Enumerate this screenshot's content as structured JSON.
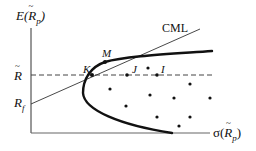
{
  "diagram": {
    "type": "efficient-frontier-cml",
    "y_axis_label": {
      "main": "E(",
      "var": "R",
      "sub": "p",
      "close": ")"
    },
    "x_axis_label": {
      "main": "σ(",
      "var": "R",
      "sub": "p",
      "close": ")"
    },
    "y_ticks": {
      "r_bar": "R",
      "r_f": {
        "main": "R",
        "sub": "f"
      }
    },
    "cml_label": "CML",
    "points": {
      "K": "K",
      "M": "M",
      "J": "J",
      "I": "I"
    },
    "colors": {
      "line": "#111111",
      "axis": "#555555",
      "dash": "#444444"
    }
  }
}
